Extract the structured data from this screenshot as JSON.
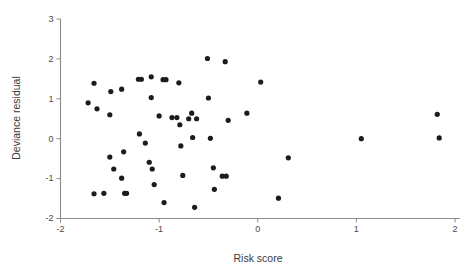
{
  "chart_data": {
    "type": "scatter",
    "title": "",
    "xlabel": "Risk score",
    "ylabel": "Deviance residual",
    "xlim": [
      -2,
      2
    ],
    "ylim": [
      -2,
      3
    ],
    "xticks": [
      -2,
      -1,
      0,
      1,
      2
    ],
    "xticklabels": [
      "-2",
      "-1",
      "0",
      "1",
      "2"
    ],
    "yticks": [
      -2,
      -1,
      0,
      1,
      2,
      3
    ],
    "yticklabels": [
      "-2",
      "-1",
      "0",
      "1",
      "2",
      "3"
    ],
    "grid": false,
    "legend": null,
    "marker": "filled-circle",
    "marker_color": "#1c1c1c",
    "marker_size": 2.6,
    "n_points": 54,
    "points": [
      {
        "x": -1.72,
        "y": 0.9
      },
      {
        "x": -1.66,
        "y": 1.39
      },
      {
        "x": -1.63,
        "y": 0.75
      },
      {
        "x": -1.5,
        "y": 0.6
      },
      {
        "x": -1.5,
        "y": -0.46
      },
      {
        "x": -1.49,
        "y": 1.18
      },
      {
        "x": -1.46,
        "y": -0.76
      },
      {
        "x": -1.66,
        "y": -1.38
      },
      {
        "x": -1.38,
        "y": 1.24
      },
      {
        "x": -1.36,
        "y": -0.33
      },
      {
        "x": -1.38,
        "y": -0.99
      },
      {
        "x": -1.35,
        "y": -1.37
      },
      {
        "x": -1.33,
        "y": -1.37
      },
      {
        "x": -1.21,
        "y": 1.49
      },
      {
        "x": -1.2,
        "y": 0.12
      },
      {
        "x": -1.14,
        "y": -0.11
      },
      {
        "x": -1.08,
        "y": 1.55
      },
      {
        "x": -1.08,
        "y": 1.03
      },
      {
        "x": -1.1,
        "y": -0.59
      },
      {
        "x": -1.07,
        "y": -0.76
      },
      {
        "x": -1.05,
        "y": -1.15
      },
      {
        "x": -1.0,
        "y": 0.57
      },
      {
        "x": -0.96,
        "y": 1.48
      },
      {
        "x": -0.95,
        "y": -1.6
      },
      {
        "x": -0.82,
        "y": 0.53
      },
      {
        "x": -0.8,
        "y": 1.4
      },
      {
        "x": -0.79,
        "y": 0.35
      },
      {
        "x": -0.78,
        "y": -0.18
      },
      {
        "x": -0.76,
        "y": -0.92
      },
      {
        "x": -0.7,
        "y": 0.5
      },
      {
        "x": -0.67,
        "y": 0.64
      },
      {
        "x": -0.66,
        "y": 0.03
      },
      {
        "x": -0.64,
        "y": -1.72
      },
      {
        "x": -0.51,
        "y": 2.01
      },
      {
        "x": -0.5,
        "y": 1.02
      },
      {
        "x": -0.48,
        "y": 0.01
      },
      {
        "x": -0.45,
        "y": -0.73
      },
      {
        "x": -0.44,
        "y": -1.27
      },
      {
        "x": -0.33,
        "y": 1.93
      },
      {
        "x": -0.32,
        "y": -0.94
      },
      {
        "x": -0.3,
        "y": 0.46
      },
      {
        "x": -0.11,
        "y": 0.64
      },
      {
        "x": 0.03,
        "y": 1.42
      },
      {
        "x": 0.21,
        "y": -1.49
      },
      {
        "x": 0.31,
        "y": -0.48
      },
      {
        "x": 1.05,
        "y": 0.0
      },
      {
        "x": 1.82,
        "y": 0.61
      },
      {
        "x": 1.84,
        "y": 0.02
      },
      {
        "x": -1.56,
        "y": -1.37
      },
      {
        "x": -1.18,
        "y": 1.49
      },
      {
        "x": -0.93,
        "y": 1.48
      },
      {
        "x": -0.62,
        "y": 0.5
      },
      {
        "x": -0.36,
        "y": -0.94
      },
      {
        "x": -0.87,
        "y": 0.53
      }
    ]
  },
  "axes": {
    "x_axis_name": "Risk score",
    "y_axis_name": "Deviance residual"
  }
}
